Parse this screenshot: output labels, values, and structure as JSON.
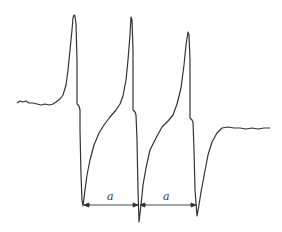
{
  "diagram": {
    "type": "waveform",
    "stroke_color": "#333333",
    "interval_labels": [
      "a",
      "a"
    ]
  }
}
